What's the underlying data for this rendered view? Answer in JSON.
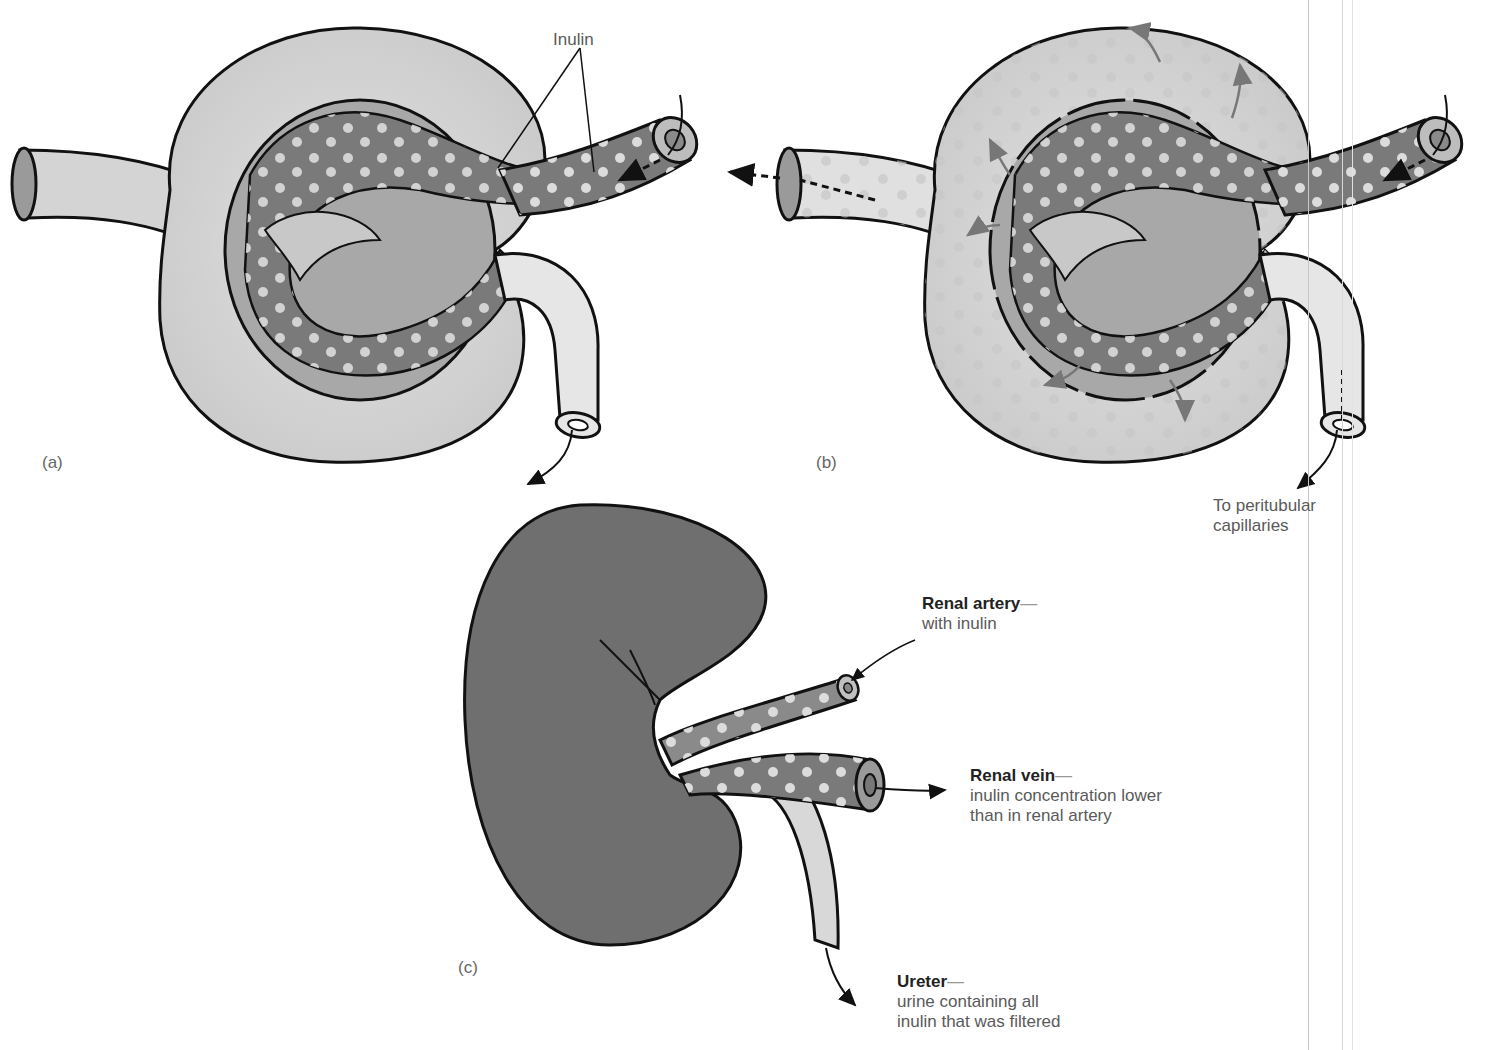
{
  "figure": {
    "panels": [
      {
        "id": "a",
        "label": "(a)"
      },
      {
        "id": "b",
        "label": "(b)"
      },
      {
        "id": "c",
        "label": "(c)"
      }
    ],
    "annotations": {
      "inulin": "Inulin",
      "to_peritubular": {
        "line1": "To peritubular",
        "line2": "capillaries"
      },
      "renal_artery": {
        "title": "Renal artery",
        "dash": "—",
        "line1": "with inulin"
      },
      "renal_vein": {
        "title": "Renal vein",
        "dash": "—",
        "line1": "inulin concentration lower",
        "line2": "than in renal artery"
      },
      "ureter": {
        "title": "Ureter",
        "dash": "—",
        "line1": "urine containing all",
        "line2": "inulin that was filtered"
      }
    },
    "colors": {
      "vessel_dark": "#7a7a7a",
      "capsule_light": "#d6d6d6",
      "kidney": "#6f6f6f",
      "inulin_dot": "#dcdcdc",
      "outline": "#111111"
    }
  }
}
